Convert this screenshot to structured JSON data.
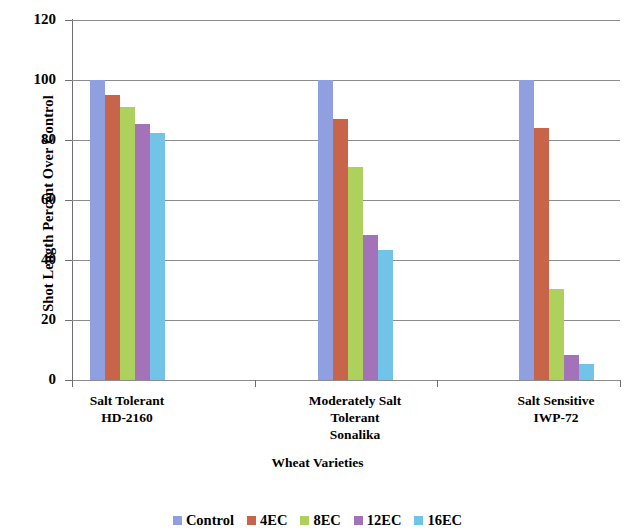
{
  "chart_data": {
    "type": "bar",
    "title": "",
    "xlabel": "Wheat Varieties",
    "ylabel": "Shot Length Percent Over Control",
    "categories": [
      "Salt Tolerant\nHD-2160",
      "Moderately Salt\nTolerant\nSonalika",
      "Salt Sensitive\nIWP-72"
    ],
    "category_lines": [
      [
        "Salt Tolerant",
        "HD-2160"
      ],
      [
        "Moderately Salt",
        "Tolerant",
        "Sonalika"
      ],
      [
        "Salt Sensitive",
        "IWP-72"
      ]
    ],
    "series": [
      {
        "name": "Control",
        "color": "#8f9fe0",
        "values": [
          100,
          100,
          100
        ]
      },
      {
        "name": "4EC",
        "color": "#c8644a",
        "values": [
          95,
          87,
          84
        ]
      },
      {
        "name": "8EC",
        "color": "#aed05c",
        "values": [
          91,
          71,
          30.5
        ]
      },
      {
        "name": "12EC",
        "color": "#a372b8",
        "values": [
          85.5,
          48.5,
          8.5
        ]
      },
      {
        "name": "16EC",
        "color": "#72c3e8",
        "values": [
          82.5,
          43.5,
          5.5
        ]
      }
    ],
    "ylim": [
      0,
      120
    ],
    "yticks": [
      0,
      20,
      40,
      60,
      80,
      100,
      120
    ],
    "ytick_labels": [
      "0",
      "20",
      "40",
      "60",
      "80",
      "100",
      "120"
    ],
    "grid": "horizontal",
    "legend_position": "bottom",
    "legend_entries": [
      "Control",
      "4EC",
      "8EC",
      "12EC",
      "16EC"
    ]
  }
}
